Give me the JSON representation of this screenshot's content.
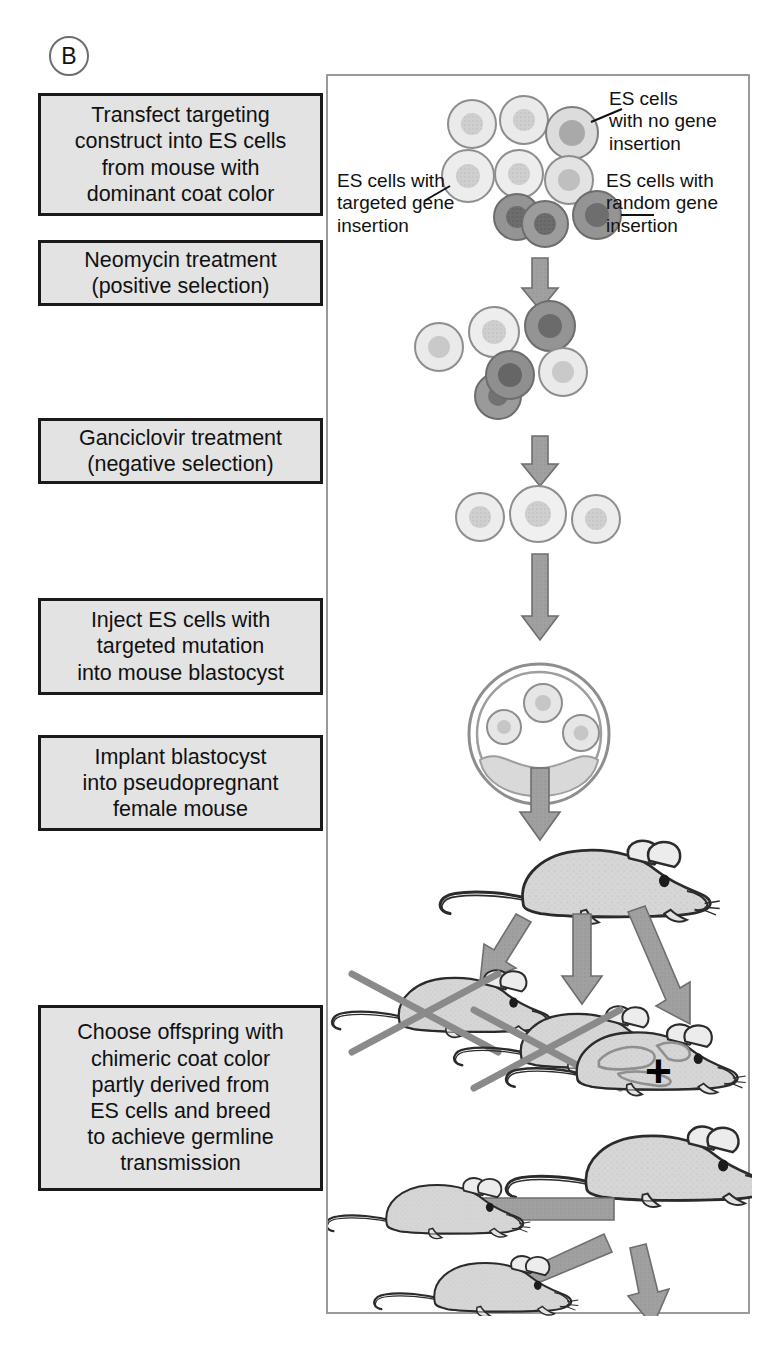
{
  "panel": {
    "letter": "B",
    "border_color": "#9a9a9a"
  },
  "theme": {
    "box_fill": "#e3e3e3",
    "box_border": "#1a1a1a",
    "text_color": "#111111",
    "arrow_fill": "#9c9c9c",
    "arrow_stroke": "#6f6f6f",
    "mouse_fill": "#d5d5d5",
    "mouse_stroke": "#2b2b2b",
    "cell_light_fill": "#e8e8e8",
    "cell_light_nucleus": "#c9c9c9",
    "cell_mid_nucleus": "#a6a6a6",
    "cell_dark_fill": "#8d8d8d",
    "cell_dark_nucleus": "#6a6a6a",
    "cross_out_color": "#8a8a8a"
  },
  "steps": [
    {
      "id": "step-1",
      "text": "Transfect targeting\nconstruct into ES cells\nfrom mouse with\ndominant coat color"
    },
    {
      "id": "step-2",
      "text": "Neomycin treatment\n(positive selection)"
    },
    {
      "id": "step-3",
      "text": "Ganciclovir treatment\n(negative selection)"
    },
    {
      "id": "step-4",
      "text": "Inject ES cells with\ntargeted mutation\ninto mouse blastocyst"
    },
    {
      "id": "step-5",
      "text": "Implant blastocyst\ninto pseudopregnant\nfemale mouse"
    },
    {
      "id": "step-6",
      "text": "Choose offspring with\nchimeric coat color\npartly derived from\nES cells and breed\nto achieve germline\ntransmission"
    }
  ],
  "callouts": [
    {
      "id": "callout-no-gene",
      "text": "ES cells\nwith no gene\ninsertion"
    },
    {
      "id": "callout-targeted",
      "text": "ES cells with\ntargeted gene\ninsertion"
    },
    {
      "id": "callout-random",
      "text": "ES cells with\nrandom gene\ninsertion"
    }
  ],
  "symbols": {
    "cross_label": "+"
  },
  "diagram": {
    "stage_1_cells": [
      {
        "cx": 144,
        "cy": 48,
        "r": 24,
        "type": "light"
      },
      {
        "cx": 196,
        "cy": 44,
        "r": 24,
        "type": "light"
      },
      {
        "cx": 243,
        "cy": 56,
        "r": 26,
        "type": "medium"
      },
      {
        "cx": 140,
        "cy": 100,
        "r": 26,
        "type": "light"
      },
      {
        "cx": 191,
        "cy": 98,
        "r": 24,
        "type": "light"
      },
      {
        "cx": 240,
        "cy": 104,
        "r": 24,
        "type": "light"
      },
      {
        "cx": 189,
        "cy": 139,
        "r": 23,
        "type": "dark"
      },
      {
        "cx": 215,
        "cy": 146,
        "r": 23,
        "type": "dark"
      },
      {
        "cx": 268,
        "cy": 138,
        "r": 24,
        "type": "dark"
      }
    ],
    "stage_2_cells": [
      {
        "cx": 111,
        "cy": 270,
        "r": 24,
        "type": "light"
      },
      {
        "cx": 166,
        "cy": 256,
        "r": 25,
        "type": "light"
      },
      {
        "cx": 221,
        "cy": 250,
        "r": 25,
        "type": "dark"
      },
      {
        "cx": 181,
        "cy": 300,
        "r": 24,
        "type": "dark"
      },
      {
        "cx": 169,
        "cy": 320,
        "r": 23,
        "type": "dark"
      },
      {
        "cx": 234,
        "cy": 295,
        "r": 24,
        "type": "light"
      }
    ],
    "stage_3_cells": [
      {
        "cx": 152,
        "cy": 440,
        "r": 24,
        "type": "light"
      },
      {
        "cx": 209,
        "cy": 437,
        "r": 28,
        "type": "light"
      },
      {
        "cx": 268,
        "cy": 442,
        "r": 24,
        "type": "light"
      }
    ],
    "blastocyst": {
      "cx": 211,
      "cy": 658,
      "r": 70,
      "inner_cells": [
        {
          "cx": 215,
          "cy": 627,
          "r": 19
        },
        {
          "cx": 176,
          "cy": 650,
          "r": 17
        },
        {
          "cx": 253,
          "cy": 656,
          "r": 18
        }
      ]
    },
    "arrows": [
      {
        "name": "arrow-transfect-to-neo",
        "x1": 212,
        "y1": 184,
        "x2": 212,
        "y2": 228,
        "width": 17
      },
      {
        "name": "arrow-neo-to-ganciclovir",
        "x1": 212,
        "y1": 362,
        "x2": 212,
        "y2": 404,
        "width": 17
      },
      {
        "name": "arrow-ganciclovir-to-inject",
        "x1": 212,
        "y1": 480,
        "x2": 212,
        "y2": 562,
        "width": 17
      },
      {
        "name": "arrow-blastocyst-to-mouse",
        "x1": 212,
        "y1": 690,
        "x2": 212,
        "y2": 764,
        "width": 19
      },
      {
        "name": "arrow-mouse-to-pup-left",
        "x1": 196,
        "y1": 834,
        "x2": 150,
        "y2": 900,
        "width": 19
      },
      {
        "name": "arrow-mouse-to-pup-mid",
        "x1": 253,
        "y1": 834,
        "x2": 253,
        "y2": 912,
        "width": 19
      },
      {
        "name": "arrow-mouse-to-pup-right",
        "x1": 303,
        "y1": 834,
        "x2": 350,
        "y2": 918,
        "width": 19
      },
      {
        "name": "arrow-breed-to-offspring-left",
        "x1": 300,
        "y1": 1135,
        "x2": 118,
        "y2": 1135,
        "width": 22
      },
      {
        "name": "arrow-breed-to-offspring-mid",
        "x1": 290,
        "y1": 1168,
        "x2": 182,
        "y2": 1208,
        "width": 22
      },
      {
        "name": "arrow-breed-to-offspring-bottom",
        "x1": 318,
        "y1": 1182,
        "x2": 300,
        "y2": 1245,
        "width": 19
      }
    ],
    "mice": [
      {
        "name": "mouse-pseudopregnant-female",
        "x": 120,
        "y": 762,
        "scale": 1.28,
        "coat": "solid"
      },
      {
        "name": "mouse-offspring-nonchimeric-1",
        "x": 12,
        "y": 898,
        "scale": 1.04,
        "coat": "solid",
        "crossed": true
      },
      {
        "name": "mouse-offspring-nonchimeric-2",
        "x": 130,
        "y": 940,
        "scale": 1.04,
        "coat": "solid",
        "crossed": true
      },
      {
        "name": "mouse-chimera",
        "x": 248,
        "y": 985,
        "scale": 1.1,
        "coat": "chimeric"
      },
      {
        "name": "mouse-breeder-chimera",
        "x": 252,
        "y": 1098,
        "scale": 1.22,
        "coat": "solid"
      },
      {
        "name": "mouse-offspring-a",
        "x": 8,
        "y": 1112,
        "scale": 0.92,
        "coat": "solid"
      },
      {
        "name": "mouse-offspring-b",
        "x": 58,
        "y": 1192,
        "scale": 0.92,
        "coat": "solid"
      },
      {
        "name": "mouse-offspring-c",
        "x": 190,
        "y": 1250,
        "scale": 0.92,
        "coat": "solid"
      }
    ]
  }
}
